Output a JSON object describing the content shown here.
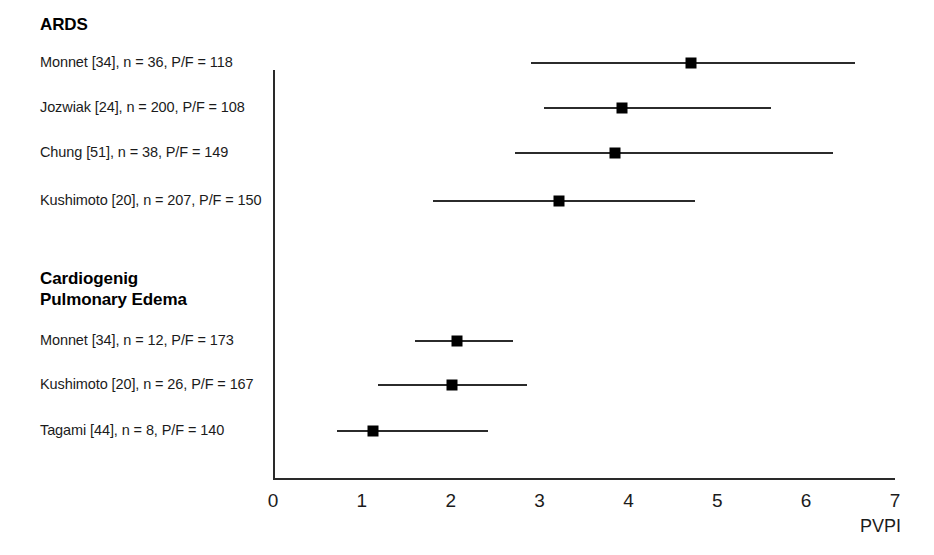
{
  "chart_data": {
    "type": "scatter",
    "title": "",
    "xlabel": "PVPI",
    "ylabel": "",
    "xlim": [
      0,
      7
    ],
    "xticks": [
      "0",
      "1",
      "2",
      "3",
      "4",
      "5",
      "6",
      "7"
    ],
    "grid": false,
    "legend": "none",
    "groups": [
      {
        "name": "ARDS",
        "rows": [
          {
            "label": "Monnet [34], n = 36, P/F = 118",
            "study": "Monnet",
            "reference": "34",
            "n": 36,
            "pf_ratio": 118,
            "value": 4.7,
            "low": 2.9,
            "high": 6.55
          },
          {
            "label": "Jozwiak [24], n = 200, P/F = 108",
            "study": "Jozwiak",
            "reference": "24",
            "n": 200,
            "pf_ratio": 108,
            "value": 3.93,
            "low": 3.05,
            "high": 5.6
          },
          {
            "label": "Chung [51], n = 38, P/F = 149",
            "study": "Chung",
            "reference": "51",
            "n": 38,
            "pf_ratio": 149,
            "value": 3.85,
            "low": 2.72,
            "high": 6.3
          },
          {
            "label": "Kushimoto [20], n = 207, P/F = 150",
            "study": "Kushimoto",
            "reference": "20",
            "n": 207,
            "pf_ratio": 150,
            "value": 3.22,
            "low": 1.8,
            "high": 4.75
          }
        ]
      },
      {
        "name": "Cardiogenig\nPulmonary Edema",
        "rows": [
          {
            "label": "Monnet [34], n = 12, P/F = 173",
            "study": "Monnet",
            "reference": "34",
            "n": 12,
            "pf_ratio": 173,
            "value": 2.07,
            "low": 1.6,
            "high": 2.7
          },
          {
            "label": "Kushimoto [20], n = 26, P/F = 167",
            "study": "Kushimoto",
            "reference": "20",
            "n": 26,
            "pf_ratio": 167,
            "value": 2.02,
            "low": 1.18,
            "high": 2.86
          },
          {
            "label": "Tagami [44], n = 8, P/F = 140",
            "study": "Tagami",
            "reference": "44",
            "n": 8,
            "pf_ratio": 140,
            "value": 1.13,
            "low": 0.72,
            "high": 2.42
          }
        ]
      }
    ]
  },
  "layout": {
    "plot_left_px": 273,
    "plot_right_px": 895,
    "axis_baseline_px": 478,
    "axis_top_px": 70,
    "row_y_px": [
      62,
      107,
      152,
      200,
      340,
      384,
      430
    ],
    "group_header_y_px": [
      14,
      268
    ],
    "axis_color": "#2a2a2a",
    "marker_color": "#000000",
    "text_color": "#1b1b1b",
    "background": "#ffffff"
  }
}
